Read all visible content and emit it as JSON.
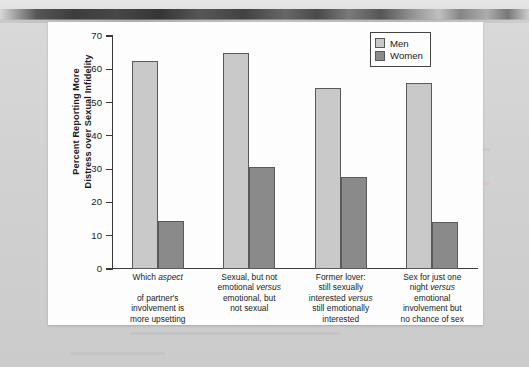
{
  "chart_data": {
    "type": "bar",
    "title": "",
    "xlabel": "",
    "ylabel": "Percent Reporting More Distress over Sexual Infidelity",
    "ylabel_line1": "Percent Reporting More",
    "ylabel_line2": "Distress over Sexual Infidelity",
    "ylim": [
      0,
      70
    ],
    "yticks": [
      70,
      60,
      50,
      40,
      30,
      20,
      10,
      0
    ],
    "grid": false,
    "legend_position": "top-right",
    "categories": [
      "Which aspect of partner's involvement is more upsetting",
      "Sexual, but not emotional versus emotional, but not sexual",
      "Former lover: still sexually interested versus still emotionally interested",
      "Sex for just one night versus emotional involvement but no chance of sex"
    ],
    "category_lines": [
      [
        "Which ",
        "aspect",
        "",
        "of partner's",
        "involvement is",
        "more upsetting"
      ],
      [
        "Sexual, but not",
        "emotional ",
        "versus",
        "emotional, but",
        "not sexual"
      ],
      [
        "Former lover:",
        "still sexually",
        "interested ",
        "versus",
        "still emotionally",
        "interested"
      ],
      [
        "Sex for just one",
        "night ",
        "versus",
        "emotional",
        "involvement but",
        "no chance of sex"
      ]
    ],
    "series": [
      {
        "name": "Men",
        "color": "#c9c9c9",
        "values": [
          62.5,
          65.0,
          54.5,
          56.0
        ]
      },
      {
        "name": "Women",
        "color": "#8a8a8a",
        "values": [
          14.5,
          30.5,
          27.5,
          14.0
        ]
      }
    ]
  },
  "legend": {
    "items": [
      {
        "label": "Men",
        "color": "#c9c9c9"
      },
      {
        "label": "Women",
        "color": "#8a8a8a"
      }
    ]
  },
  "colors": {
    "men_bar": "#c9c9c9",
    "women_bar": "#8a8a8a",
    "bar_outline": "#5a5a5a",
    "axis": "#3a3a3a",
    "panel_background": "#fdfdfd",
    "page_background": "#cfcfcf",
    "text": "#1b1b1b"
  }
}
